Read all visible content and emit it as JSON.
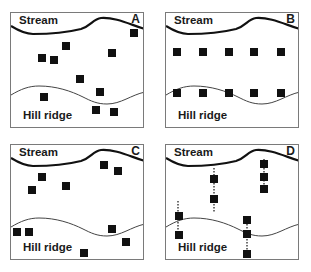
{
  "figure": {
    "colors": {
      "ink": "#111111",
      "stream": "#111111",
      "ridge": "#444444",
      "border": "#7a7a7a",
      "background": "#ffffff"
    },
    "stream_label": "Stream",
    "ridge_label": "Hill ridge",
    "panels": [
      {
        "id": "A",
        "letter": "A",
        "pattern": "random",
        "boxes": [
          [
            123,
            20
          ],
          [
            55,
            33
          ],
          [
            31,
            45
          ],
          [
            43,
            47
          ],
          [
            101,
            40
          ],
          [
            69,
            66
          ],
          [
            89,
            79
          ],
          [
            33,
            84
          ],
          [
            85,
            97
          ],
          [
            103,
            99
          ]
        ],
        "dotted_lines": []
      },
      {
        "id": "B",
        "letter": "B",
        "pattern": "systematic-grid",
        "boxes": [
          [
            11,
            39
          ],
          [
            37,
            39
          ],
          [
            63,
            39
          ],
          [
            88,
            39
          ],
          [
            115,
            39
          ],
          [
            11,
            80
          ],
          [
            37,
            80
          ],
          [
            63,
            80
          ],
          [
            88,
            80
          ],
          [
            115,
            80
          ]
        ],
        "dotted_lines": []
      },
      {
        "id": "C",
        "letter": "C",
        "pattern": "clustered",
        "boxes": [
          [
            93,
            20
          ],
          [
            107,
            26
          ],
          [
            31,
            32
          ],
          [
            21,
            45
          ],
          [
            55,
            41
          ],
          [
            6,
            87
          ],
          [
            18,
            87
          ],
          [
            101,
            84
          ],
          [
            115,
            97
          ],
          [
            73,
            108
          ]
        ],
        "dotted_lines": []
      },
      {
        "id": "D",
        "letter": "D",
        "pattern": "transects",
        "boxes": [
          [
            48,
            34
          ],
          [
            48,
            54
          ],
          [
            98,
            19
          ],
          [
            98,
            32
          ],
          [
            98,
            44
          ],
          [
            13,
            71
          ],
          [
            13,
            90
          ],
          [
            81,
            75
          ],
          [
            81,
            89
          ],
          [
            81,
            109
          ]
        ],
        "dotted_lines": [
          [
            48,
            23,
            48,
            67
          ],
          [
            98,
            14,
            98,
            43
          ],
          [
            12,
            56,
            12,
            88
          ],
          [
            81,
            73,
            81,
            108
          ]
        ]
      }
    ],
    "stream_path": "M0,13 C8,18 14,21 22,21 C40,21 58,19 70,16 C80,13 82,6 90,5 C105,4 120,12 134,16",
    "ridge_path": "M0,82 C10,76 18,73 28,73 C45,73 60,78 72,84 C80,88 86,91 96,91 C110,91 120,82 134,79"
  }
}
